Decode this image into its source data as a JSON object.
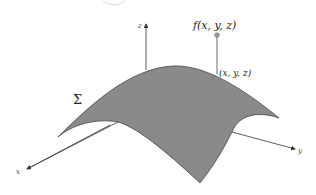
{
  "diagram": {
    "surface_label": "Σ",
    "function_label": "f(x, y, z)",
    "point_label": "(x, y, z)",
    "axes": {
      "x": "x",
      "y": "y",
      "z": "z"
    },
    "colors": {
      "surface_fill": "#8a8a8a",
      "surface_edge": "#333333",
      "axis": "#333333",
      "point": "#999999",
      "background": "#ffffff"
    }
  }
}
